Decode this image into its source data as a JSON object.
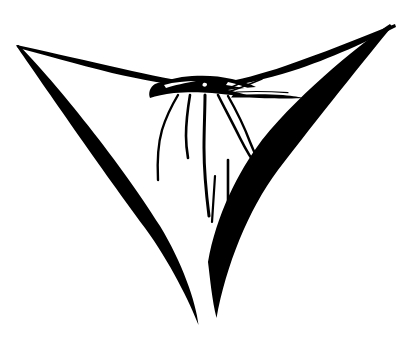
{
  "image": {
    "title": "Bandana / Neckerchief Line Drawing",
    "subject": "folded triangular cloth with gathered knot",
    "style": "black and white clip art line drawing",
    "canvas_width": 407,
    "canvas_height": 345,
    "background_color": "#ffffff",
    "ink_color": "#000000"
  },
  "artwork": {
    "alt_text": "A black ink line drawing of a triangular bandana or neckerchief, gathered and knotted at the top center, with fabric folds hanging down toward the lower point.",
    "shapes": {
      "outline_name": "bandana-outline",
      "knot_name": "gathered-knot",
      "folds_name": "fabric-folds",
      "tail_name": "knot-tail"
    },
    "key_points": {
      "left_corner": "16,45",
      "right_corner": "395,24",
      "bottom_point": "198,325",
      "bottom_secondary_point": "216,318",
      "knot_center": "205,88"
    },
    "fold_count": 7
  }
}
